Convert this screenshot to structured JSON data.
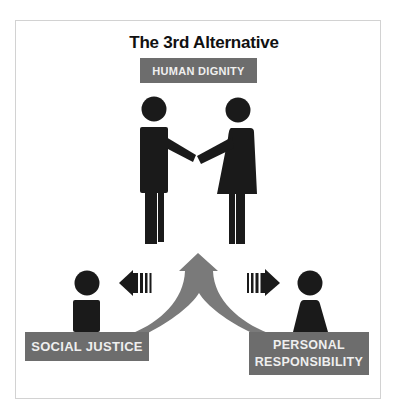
{
  "title": "The 3rd Alternative",
  "top_label": "HUMAN DIGNITY",
  "bottom_left_label": "SOCIAL JUSTICE",
  "bottom_right_label": {
    "line1": "PERSONAL",
    "line2": "RESPONSIBILITY"
  },
  "colors": {
    "label_bg": "#6d6d6d",
    "label_text": "#efefef",
    "figure": "#1a1a1a",
    "central_arrow": "#7a7a7a",
    "frame_border": "#d2d2d2"
  },
  "icons": {
    "center_figures": [
      "man-figure-icon",
      "woman-figure-icon",
      "handshake"
    ],
    "left_figure": "person-icon",
    "right_figure": "person-icon",
    "left_arrow": "striped-arrow-left-icon",
    "right_arrow": "striped-arrow-right-icon",
    "central_arrow": "merging-arrow-up-icon"
  }
}
